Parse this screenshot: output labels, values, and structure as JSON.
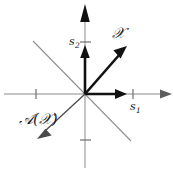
{
  "figure": {
    "title": "",
    "background_color": "#ffffff",
    "width": 173,
    "height": 172
  },
  "axes": {
    "origin": {
      "x": 85,
      "y": 94
    },
    "horizontal": {
      "name": "s1-axis",
      "label": "s",
      "subscript": "1",
      "color": "#8a8a8a",
      "tick_positions_px": [
        36,
        133
      ]
    },
    "vertical": {
      "name": "s2-axis",
      "label": "s",
      "subscript": "2",
      "color": "#8a8a8a",
      "tick_positions_px": [
        42,
        140
      ]
    }
  },
  "vectors": [
    {
      "name": "x-vector",
      "label": "𝒳",
      "label_plain": "X",
      "color": "#111111",
      "from": {
        "x": 85,
        "y": 94
      },
      "to": {
        "x": 126,
        "y": 47
      },
      "style": "thick"
    },
    {
      "name": "ax-vector",
      "label": "𝒜(𝒳)",
      "label_plain": "A(X)",
      "color": "#4a4a4a",
      "from": {
        "x": 85,
        "y": 94
      },
      "to": {
        "x": 39,
        "y": 137
      },
      "style": "thin"
    },
    {
      "name": "s1-axis-vector",
      "label": "",
      "color": "#111111",
      "from": {
        "x": 85,
        "y": 94
      },
      "to": {
        "x": 126,
        "y": 94
      },
      "style": "thick"
    },
    {
      "name": "s2-axis-vector",
      "label": "",
      "color": "#111111",
      "from": {
        "x": 85,
        "y": 94
      },
      "to": {
        "x": 85,
        "y": 47
      },
      "style": "thick"
    }
  ],
  "guide_lines": [
    {
      "name": "antidiagonal-upper-left",
      "color": "#8f8f8f",
      "from": {
        "x": 33,
        "y": 41
      },
      "to": {
        "x": 85,
        "y": 94
      }
    },
    {
      "name": "antidiagonal-lower-right",
      "color": "#8f8f8f",
      "from": {
        "x": 85,
        "y": 94
      },
      "to": {
        "x": 131,
        "y": 141
      }
    }
  ],
  "labels": {
    "x_vector": "𝒳",
    "ax_vector": "𝒜(𝒳)",
    "s1_base": "s",
    "s1_sub": "1",
    "s2_base": "s",
    "s2_sub": "2"
  }
}
